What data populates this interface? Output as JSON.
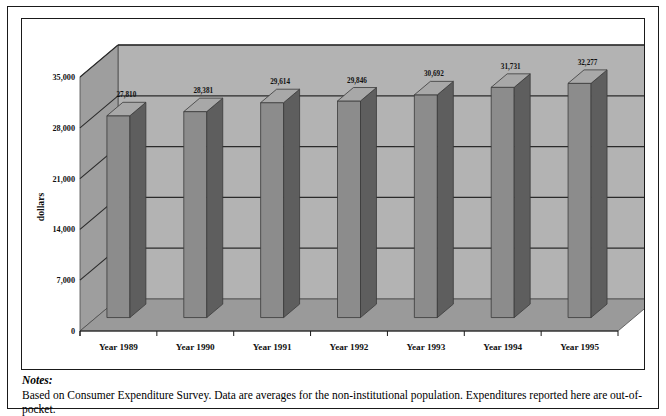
{
  "chart_data": {
    "type": "bar",
    "title": "",
    "xlabel": "",
    "ylabel": "dollars",
    "categories": [
      "Year 1989",
      "Year 1990",
      "Year 1991",
      "Year 1992",
      "Year 1993",
      "Year 1994",
      "Year 1995"
    ],
    "values": [
      27810,
      28381,
      29614,
      29846,
      30692,
      31731,
      32277
    ],
    "value_labels": [
      "27,810",
      "28,381",
      "29,614",
      "29,846",
      "30,692",
      "31,731",
      "32,277"
    ],
    "ylim": [
      0,
      35000
    ],
    "yticks": [
      0,
      7000,
      14000,
      21000,
      28000,
      35000
    ],
    "ytick_labels": [
      "0",
      "7,000",
      "14,000",
      "21,000",
      "28,000",
      "35,000"
    ],
    "grid": true,
    "legend": "none",
    "style": "3d-column",
    "colors": {
      "bar_front": "#8c8c8c",
      "bar_side": "#5e5e5e",
      "bar_top": "#a8a8a8",
      "wall_back": "#b3b3b3",
      "wall_side": "#9e9e9e",
      "floor": "#9a9a9a",
      "gridline": "#2b2b2b",
      "frame": "#1a1a1a",
      "text": "#111111",
      "page_background": "#ffffff"
    }
  },
  "notes": {
    "heading": "Notes:",
    "body": "Based on Consumer Expenditure Survey. Data are averages for the non-institutional population. Expenditures reported here are out-of-pocket."
  }
}
